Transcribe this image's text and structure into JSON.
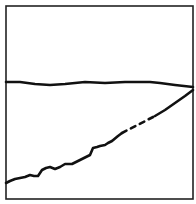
{
  "chart_data": {
    "type": "line",
    "title": "",
    "xlabel": "",
    "ylabel": "",
    "grid": false,
    "legend": null,
    "frame": {
      "x0": 6,
      "y0": 6,
      "x1": 193,
      "y1": 199
    },
    "series": [
      {
        "name": "upper-line",
        "style": "solid",
        "color": "#111111",
        "points": [
          [
            6,
            82
          ],
          [
            20,
            82
          ],
          [
            35,
            84
          ],
          [
            50,
            85
          ],
          [
            65,
            84
          ],
          [
            85,
            82
          ],
          [
            105,
            83
          ],
          [
            125,
            82
          ],
          [
            150,
            82
          ],
          [
            160,
            83
          ],
          [
            175,
            85
          ],
          [
            193,
            87
          ]
        ]
      },
      {
        "name": "lower-line-solid-start",
        "style": "solid",
        "color": "#111111",
        "points": [
          [
            6,
            183
          ],
          [
            10,
            181
          ],
          [
            15,
            179
          ],
          [
            20,
            178
          ],
          [
            25,
            177
          ],
          [
            30,
            175
          ],
          [
            34,
            176
          ],
          [
            38,
            176
          ],
          [
            42,
            170
          ],
          [
            46,
            168
          ],
          [
            50,
            167
          ],
          [
            55,
            169
          ],
          [
            60,
            167
          ],
          [
            65,
            164
          ],
          [
            72,
            164
          ],
          [
            80,
            160
          ],
          [
            86,
            157
          ],
          [
            90,
            155
          ],
          [
            93,
            148
          ],
          [
            97,
            147
          ],
          [
            100,
            146
          ],
          [
            105,
            145
          ],
          [
            108,
            143
          ],
          [
            112,
            141
          ],
          [
            118,
            136
          ],
          [
            122,
            133
          ]
        ]
      },
      {
        "name": "lower-line-dashed",
        "style": "dashed",
        "color": "#111111",
        "points": [
          [
            122,
            133
          ],
          [
            155,
            116
          ]
        ]
      },
      {
        "name": "lower-line-solid-end",
        "style": "solid",
        "color": "#111111",
        "points": [
          [
            155,
            116
          ],
          [
            165,
            110
          ],
          [
            175,
            103
          ],
          [
            185,
            96
          ],
          [
            193,
            90
          ]
        ]
      }
    ]
  }
}
